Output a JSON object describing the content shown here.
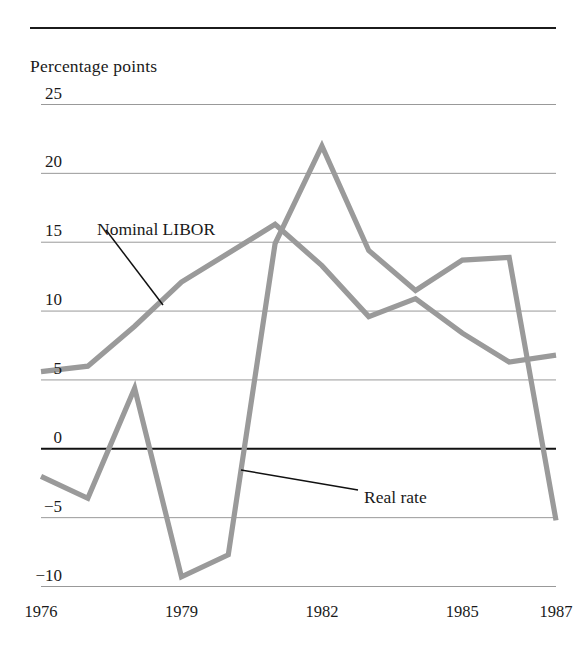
{
  "figure": {
    "axis_title": "Percentage points",
    "top_rule": true,
    "background_color": "#ffffff",
    "line_color": "#9a9a9a",
    "grid_color": "#8d8d8d",
    "zero_line_color": "#111111",
    "text_color": "#1a1a1a"
  },
  "annotations": [
    {
      "label": "Nominal LIBOR",
      "x": 97,
      "y": 219,
      "leader": {
        "x1": 106,
        "y1": 230,
        "x2": 163,
        "y2": 305
      }
    },
    {
      "label": "Real rate",
      "x": 364,
      "y": 487,
      "leader": {
        "x1": 358,
        "y1": 490,
        "x2": 241,
        "y2": 470
      }
    }
  ],
  "chart_data": {
    "type": "line",
    "title": "",
    "subtitle": "",
    "xlabel": "",
    "ylabel": "Percentage points",
    "ylim": [
      -10,
      25
    ],
    "xlim": [
      1976,
      1987
    ],
    "grid": true,
    "legend": "inline-annotations",
    "yticks": [
      25,
      20,
      15,
      10,
      5,
      0,
      -5,
      -10
    ],
    "ytick_labels": [
      "25",
      "20",
      "15",
      "10",
      "5",
      "0",
      "−5",
      "−10"
    ],
    "xticks": [
      1976,
      1979,
      1982,
      1985,
      1987
    ],
    "xtick_labels": [
      "1976",
      "1979",
      "1982",
      "1985",
      "1987"
    ],
    "x": [
      1976,
      1977,
      1978,
      1979,
      1980,
      1981,
      1982,
      1983,
      1984,
      1985,
      1986,
      1987
    ],
    "series": [
      {
        "name": "Nominal LIBOR",
        "color": "#9a9a9a",
        "values": [
          5.6,
          6.0,
          8.9,
          12.1,
          14.2,
          16.3,
          13.3,
          9.6,
          10.9,
          8.4,
          6.3,
          6.8
        ]
      },
      {
        "name": "Real rate",
        "color": "#9a9a9a",
        "values": [
          -2.0,
          -3.6,
          4.4,
          -9.3,
          -7.7,
          14.9,
          22.0,
          14.4,
          11.5,
          13.7,
          13.9,
          -5.2
        ]
      }
    ]
  }
}
